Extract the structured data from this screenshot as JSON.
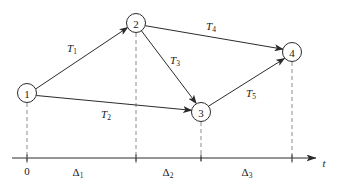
{
  "figure": {
    "type": "timed-event-graph",
    "background": "#ffffff",
    "ink_color": "#2b2b2b",
    "guide_color": "#8c8c8c",
    "width": 337,
    "height": 187
  },
  "nodes": [
    {
      "id": "node-1",
      "label": "1",
      "cx": 27,
      "cy": 93,
      "r": 9.5,
      "guide_to_axis": true
    },
    {
      "id": "node-2",
      "label": "2",
      "cx": 136,
      "cy": 23,
      "r": 9.5,
      "guide_to_axis": true
    },
    {
      "id": "node-3",
      "label": "3",
      "cx": 201,
      "cy": 112,
      "r": 9.5,
      "guide_to_axis": true
    },
    {
      "id": "node-4",
      "label": "4",
      "cx": 292,
      "cy": 52,
      "r": 9.5,
      "guide_to_axis": true
    }
  ],
  "edges": [
    {
      "id": "edge-T1",
      "from": "node-1",
      "to": "node-2",
      "label": "T",
      "subscript": "1",
      "label_x": 72,
      "label_y": 48
    },
    {
      "id": "edge-T2",
      "from": "node-1",
      "to": "node-3",
      "label": "T",
      "subscript": "2",
      "label_x": 106,
      "label_y": 114
    },
    {
      "id": "edge-T3",
      "from": "node-2",
      "to": "node-3",
      "label": "T",
      "subscript": "3",
      "label_x": 175,
      "label_y": 60
    },
    {
      "id": "edge-T4",
      "from": "node-2",
      "to": "node-4",
      "label": "T",
      "subscript": "4",
      "label_x": 211,
      "label_y": 26
    },
    {
      "id": "edge-T5",
      "from": "node-3",
      "to": "node-4",
      "label": "T",
      "subscript": "5",
      "label_x": 251,
      "label_y": 93
    }
  ],
  "axis": {
    "y": 158,
    "x_start": 12,
    "x_end": 316,
    "variable_label": "t",
    "variable_x": 324,
    "variable_y": 163,
    "origin_label": "0",
    "origin_x": 27,
    "origin_label_y": 171,
    "ticks": [
      27,
      136,
      201,
      292
    ],
    "intervals": [
      {
        "id": "interval-delta-1",
        "label": "Δ",
        "subscript": "1",
        "label_x": 78,
        "label_y": 172
      },
      {
        "id": "interval-delta-2",
        "label": "Δ",
        "subscript": "2",
        "label_x": 168,
        "label_y": 172
      },
      {
        "id": "interval-delta-3",
        "label": "Δ",
        "subscript": "3",
        "label_x": 247,
        "label_y": 172
      }
    ]
  }
}
